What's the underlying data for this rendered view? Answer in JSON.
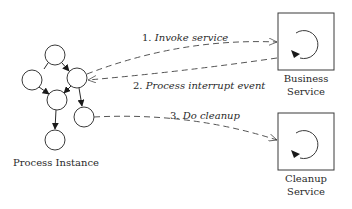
{
  "diagram": {
    "process_instance": {
      "label": "Process Instance",
      "nodes": [
        {
          "id": "top",
          "cx": 55,
          "cy": 55
        },
        {
          "id": "left",
          "cx": 32,
          "cy": 80
        },
        {
          "id": "right",
          "cx": 77,
          "cy": 78
        },
        {
          "id": "middle",
          "cx": 57,
          "cy": 100
        },
        {
          "id": "lower-right",
          "cx": 84,
          "cy": 117
        },
        {
          "id": "bottom",
          "cx": 55,
          "cy": 140
        }
      ]
    },
    "services": [
      {
        "id": "business",
        "line1": "Business",
        "line2": "Service"
      },
      {
        "id": "cleanup",
        "line1": "Cleanup",
        "line2": "Service"
      }
    ],
    "messages": [
      {
        "number": "1.",
        "text": "Invoke service",
        "full": "1. Invoke service"
      },
      {
        "number": "2.",
        "text": "Process interrupt event",
        "full": "2. Process interrupt event"
      },
      {
        "number": "3.",
        "text": "Do cleanup",
        "full": "3. Do cleanup"
      }
    ],
    "colors": {
      "stroke": "#3a3a3a",
      "text": "#2a2a2a",
      "background": "#ffffff"
    }
  }
}
